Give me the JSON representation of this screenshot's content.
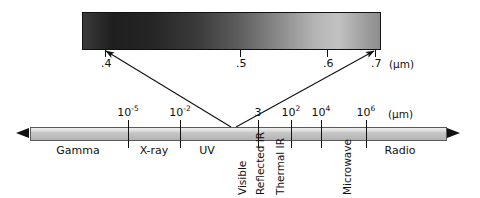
{
  "figure": {
    "unit_label": "(µm)"
  },
  "visible_swatch": {
    "name": "visible-light-gradient",
    "wavelength_start": 0.4,
    "wavelength_end": 0.7,
    "ticks": [
      {
        "label": ".4",
        "value": 0.4,
        "x": 105
      },
      {
        "label": ".5",
        "value": 0.5,
        "x": 240
      },
      {
        "label": ".6",
        "value": 0.6,
        "x": 327
      },
      {
        "label": ".7",
        "value": 0.7,
        "x": 375
      }
    ],
    "unit": "(µm)"
  },
  "spectrum": {
    "unit": "(µm)",
    "ticks": [
      {
        "label_base": "10",
        "label_exp": "-5",
        "x": 128
      },
      {
        "label_base": "10",
        "label_exp": "-2",
        "x": 180
      },
      {
        "label_base": "3",
        "label_exp": "",
        "x": 258
      },
      {
        "label_base": "10",
        "label_exp": "2",
        "x": 291
      },
      {
        "label_base": "10",
        "label_exp": "4",
        "x": 321
      },
      {
        "label_base": "10",
        "label_exp": "6",
        "x": 366
      }
    ],
    "bands_horizontal": [
      {
        "label": "Gamma",
        "x": 78
      },
      {
        "label": "X-ray",
        "x": 154
      },
      {
        "label": "UV",
        "x": 207
      },
      {
        "label": "Radio",
        "x": 400
      }
    ],
    "bands_vertical": [
      {
        "label": "Visible",
        "x": 236,
        "y": 195
      },
      {
        "label": "Reflected IR",
        "x": 254,
        "y": 195
      },
      {
        "label": "Thermal IR",
        "x": 274,
        "y": 195
      },
      {
        "label": "Microwave",
        "x": 341,
        "y": 195
      }
    ]
  },
  "callouts": {
    "left_line": {
      "from_x": 231,
      "from_y": 127,
      "to_x": 106,
      "to_y": 51
    },
    "right_line": {
      "from_x": 236,
      "from_y": 127,
      "to_x": 374,
      "to_y": 51
    }
  },
  "colors": {
    "ink": "#111111",
    "bar_fill": "#c6c6c6",
    "bar_stroke": "#5a5a5a",
    "swatch_dark": "#1f1f1f",
    "swatch_light": "#c2c2c2",
    "background": "#ffffff"
  }
}
